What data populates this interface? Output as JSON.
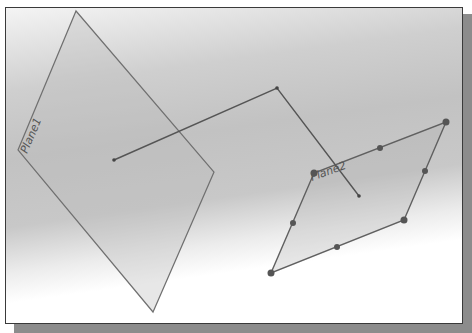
{
  "scene": {
    "planes": [
      {
        "name": "Plane1",
        "label": "Plane1",
        "vertices": [
          [
            76,
            11
          ],
          [
            214,
            172
          ],
          [
            153,
            312
          ],
          [
            18,
            150
          ]
        ]
      },
      {
        "name": "Plane2",
        "label": "Plane2",
        "vertices": [
          [
            446,
            122
          ],
          [
            404,
            220
          ],
          [
            271,
            273
          ],
          [
            314,
            173
          ]
        ],
        "handles": [
          [
            446,
            122
          ],
          [
            425,
            171
          ],
          [
            404,
            220
          ],
          [
            337,
            247
          ],
          [
            271,
            273
          ],
          [
            293,
            223
          ],
          [
            314,
            173
          ],
          [
            380,
            148
          ]
        ]
      }
    ],
    "sketch_polyline": [
      [
        114,
        160
      ],
      [
        277,
        88
      ],
      [
        359,
        196
      ]
    ],
    "colors": {
      "plane_edge": "#6a6a6a",
      "plane_fill": "#b8b8b8",
      "line": "#555555",
      "handle": "#5a5a5a"
    }
  }
}
